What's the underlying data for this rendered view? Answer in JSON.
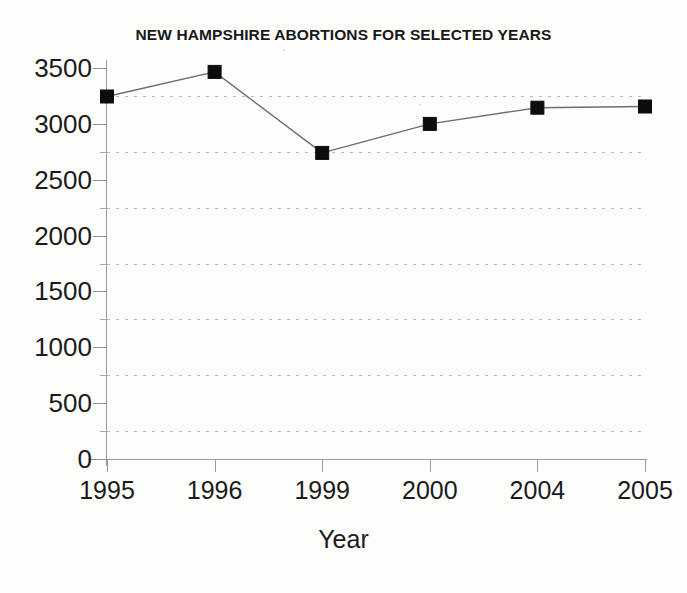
{
  "chart_data": {
    "type": "line",
    "title": "NEW HAMPSHIRE ABORTIONS FOR SELECTED YEARS",
    "xlabel": "Year",
    "ylabel": "",
    "categories": [
      "1995",
      "1996",
      "1999",
      "2000",
      "2004",
      "2005"
    ],
    "values": [
      3245,
      3465,
      2740,
      3000,
      3145,
      3155
    ],
    "series": [
      {
        "name": "New Hampshire abortions",
        "values": [
          3245,
          3465,
          2740,
          3000,
          3145,
          3155
        ]
      }
    ],
    "ylim": [
      0,
      3500
    ],
    "y_major_ticks": [
      0,
      500,
      1000,
      1500,
      2000,
      2500,
      3000,
      3500
    ],
    "y_tick_labels": [
      "0",
      "500",
      "1000",
      "1500",
      "2000",
      "2500",
      "3000",
      "3500"
    ],
    "y_minor_ticks": [
      250,
      750,
      1250,
      1750,
      2250,
      2750,
      3250
    ],
    "gridlines": [
      250,
      750,
      1250,
      1750,
      2250,
      2750,
      3250
    ],
    "grid": true,
    "grid_style": "dotted",
    "grid_axis": "y",
    "legend": false,
    "legend_position": "none",
    "marker": "square",
    "marker_color": "#0d0d0d",
    "line_color": "#6d6d6d",
    "background_color": "#fdfdfc"
  }
}
